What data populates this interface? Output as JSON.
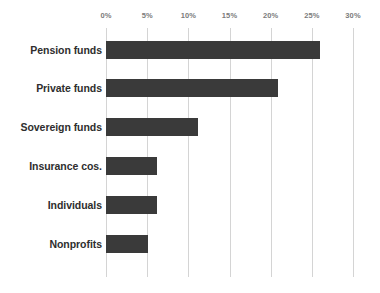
{
  "chart_data": {
    "type": "bar",
    "orientation": "horizontal",
    "title": "",
    "subtitle": "",
    "xlabel": "",
    "ylabel": "",
    "categories": [
      "Pension funds",
      "Private funds",
      "Sovereign funds",
      "Insurance cos.",
      "Individuals",
      "Nonprofits"
    ],
    "values": [
      26.0,
      20.9,
      11.2,
      6.2,
      6.2,
      5.1
    ],
    "xlim": [
      0,
      30
    ],
    "ylim": null,
    "xticks": [
      0,
      5,
      10,
      15,
      20,
      25,
      30
    ],
    "xtick_labels": [
      "0%",
      "5%",
      "10%",
      "15%",
      "20%",
      "25%",
      "30%"
    ],
    "grid": "vertical",
    "legend": null,
    "legend_position": "none",
    "annotations": [],
    "bar_color": "#3a3a3a",
    "gridline_color": "#d4d4d4",
    "background_color": "#ffffff",
    "tick_label_color": "#7b7b7b",
    "category_label_color": "#2e2e2e"
  }
}
